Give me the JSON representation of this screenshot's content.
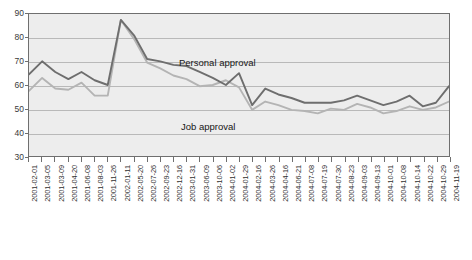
{
  "chart_data": {
    "type": "line",
    "title": "",
    "subtitle": "",
    "xlabel": "",
    "ylabel": "",
    "ylim": [
      30,
      90
    ],
    "yticks": [
      30,
      40,
      50,
      60,
      70,
      80,
      90
    ],
    "grid": true,
    "legend_position": "inline-annotation",
    "annotations": [
      {
        "text": "Personal approval",
        "series": "Personal approval"
      },
      {
        "text": "Job approval",
        "series": "Job approval"
      }
    ],
    "categories": [
      "2001-02-01",
      "2001-03-05",
      "2001-03-09",
      "2001-04-20",
      "2001-06-08",
      "2001-08-03",
      "2001-11-26",
      "2002-01-11",
      "2002-05-20",
      "2002-07-26",
      "2002-09-23",
      "2002-12-16",
      "2003-01-31",
      "2003-06-09",
      "2003-10-06",
      "2004-01-02",
      "2004-01-29",
      "2004-02-16",
      "2004-03-26",
      "2004-04-16",
      "2004-06-21",
      "2004-07-08",
      "2004-07-19",
      "2004-07-30",
      "2004-08-23",
      "2004-09-03",
      "2004-09-13",
      "2004-10-01",
      "2004-10-08",
      "2004-10-14",
      "2004-10-22",
      "2004-10-29",
      "2004-11-19"
    ],
    "series": [
      {
        "name": "Personal approval",
        "color": "#6e6e6e",
        "values": [
          64.5,
          70.0,
          65.5,
          62.5,
          65.5,
          62.0,
          60.0,
          87.5,
          81.0,
          71.0,
          70.0,
          68.5,
          68.0,
          65.5,
          63.0,
          60.0,
          65.0,
          51.5,
          58.5,
          56.0,
          54.5,
          52.5,
          52.5,
          52.5,
          53.5,
          55.5,
          53.5,
          51.5,
          53.0,
          55.5,
          51.0,
          52.5,
          59.5
        ]
      },
      {
        "name": "Job approval",
        "color": "#b4b4b4",
        "values": [
          57.5,
          63.0,
          58.5,
          58.0,
          61.0,
          55.5,
          55.5,
          87.5,
          79.5,
          69.5,
          67.0,
          64.0,
          62.5,
          59.5,
          60.0,
          62.0,
          59.0,
          49.5,
          53.0,
          51.5,
          49.5,
          49.0,
          48.0,
          50.0,
          49.5,
          52.0,
          50.5,
          48.0,
          49.0,
          51.0,
          49.5,
          50.5,
          53.0
        ]
      }
    ]
  },
  "axes": {
    "y_tick_labels": [
      "90",
      "80",
      "70",
      "60",
      "50",
      "40",
      "30"
    ]
  },
  "labels": {
    "personal": "Personal approval",
    "job": "Job approval"
  },
  "colors": {
    "plot_background": "#ededed",
    "page_background": "#ffffff",
    "gridline": "#b9b9b9",
    "axis": "#6f6f6f",
    "personal_line": "#6e6e6e",
    "job_line": "#b4b4b4",
    "tick_text": "#2f2f2f"
  }
}
